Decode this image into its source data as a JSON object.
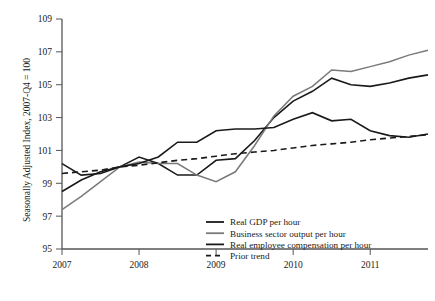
{
  "chart_data": {
    "type": "line",
    "title": "",
    "xlabel": "",
    "ylabel": "Seasonally Adjusted Index, 2007-Q4 = 100",
    "xlim": [
      2007.0,
      2011.75
    ],
    "ylim": [
      95,
      109
    ],
    "yticks": [
      95,
      97,
      99,
      101,
      103,
      105,
      107,
      109
    ],
    "xticks": [
      2007,
      2008,
      2009,
      2010,
      2011
    ],
    "xtick_labels": [
      "2007",
      "2008",
      "2009",
      "2010",
      "2011"
    ],
    "ytick_labels": [
      "95",
      "97",
      "99",
      "101",
      "103",
      "105",
      "107",
      "109"
    ],
    "grid": false,
    "legend_position": "bottom-right",
    "x": [
      2007.0,
      2007.25,
      2007.5,
      2007.75,
      2008.0,
      2008.25,
      2008.5,
      2008.75,
      2009.0,
      2009.25,
      2009.5,
      2009.75,
      2010.0,
      2010.25,
      2010.5,
      2010.75,
      2011.0,
      2011.25,
      2011.5,
      2011.75
    ],
    "series": [
      {
        "name": "Real GDP per hour",
        "color": "#1a1a1a",
        "style": "solid",
        "width": 1.6,
        "values": [
          100.2,
          99.5,
          99.6,
          100.0,
          100.6,
          100.2,
          99.5,
          99.5,
          100.4,
          100.5,
          101.6,
          103.0,
          104.0,
          104.6,
          105.4,
          105.0,
          104.9,
          105.1,
          105.4,
          105.6
        ]
      },
      {
        "name": "Business sector output per hour",
        "color": "#7a7a7a",
        "style": "solid",
        "width": 1.5,
        "values": [
          97.4,
          98.2,
          99.1,
          100.0,
          100.3,
          100.2,
          100.2,
          99.5,
          99.1,
          99.7,
          101.3,
          103.1,
          104.3,
          104.9,
          105.9,
          105.8,
          106.1,
          106.4,
          106.8,
          107.1
        ]
      },
      {
        "name": "Real employee compensation per hour",
        "color": "#1a1a1a",
        "style": "solid",
        "width": 1.6,
        "values": [
          98.5,
          99.2,
          99.7,
          100.0,
          100.2,
          100.6,
          101.5,
          101.5,
          102.2,
          102.3,
          102.3,
          102.4,
          102.9,
          103.3,
          102.8,
          102.9,
          102.2,
          101.9,
          101.8,
          102.0
        ]
      },
      {
        "name": "Prior trend",
        "color": "#1a1a1a",
        "style": "dashed",
        "width": 1.6,
        "values": [
          99.6,
          99.7,
          99.8,
          100.0,
          100.1,
          100.25,
          100.4,
          100.5,
          100.65,
          100.8,
          100.9,
          101.0,
          101.15,
          101.3,
          101.4,
          101.5,
          101.65,
          101.75,
          101.85,
          101.95
        ]
      }
    ]
  },
  "legend": {
    "items": [
      {
        "label": "Real GDP per hour",
        "color": "#1a1a1a",
        "style": "solid"
      },
      {
        "label": "Business sector output per hour",
        "color": "#7a7a7a",
        "style": "solid"
      },
      {
        "label": "Real employee compensation per hour",
        "color": "#1a1a1a",
        "style": "solid"
      },
      {
        "label": "Prior trend",
        "color": "#1a1a1a",
        "style": "dashed"
      }
    ]
  },
  "axes": {
    "y_title": "Seasonally Adjusted Index, 2007-Q4 = 100",
    "axis_color": "#555555"
  }
}
